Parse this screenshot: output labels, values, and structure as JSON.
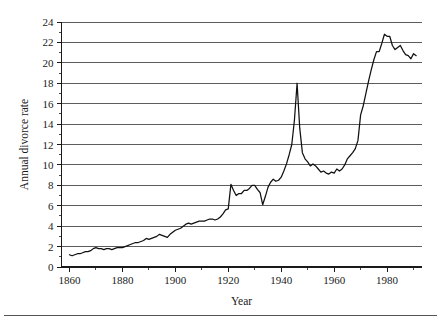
{
  "figure": {
    "background": "#ffffff",
    "line_color": "#111111",
    "grid_color": "#4a4a4a",
    "axis_color": "#1a1a1a",
    "footer_rule": true
  },
  "labels": {
    "ylabel": "Annual divorce rate",
    "xlabel": "Year"
  },
  "chart_data": {
    "type": "line",
    "title": "",
    "xlabel": "Year",
    "ylabel": "Annual divorce rate",
    "xlim": [
      1857,
      1993
    ],
    "ylim": [
      0,
      24
    ],
    "xticks": [
      1860,
      1880,
      1900,
      1920,
      1940,
      1960,
      1980
    ],
    "xticklabels": [
      "1860",
      "1880",
      "1900",
      "1920",
      "1940",
      "1960",
      "1980"
    ],
    "xminorticks": [
      1870,
      1890,
      1910,
      1930,
      1950,
      1970,
      1990
    ],
    "yticks": [
      0,
      2,
      4,
      6,
      8,
      10,
      12,
      14,
      16,
      18,
      20,
      22,
      24
    ],
    "yticklabels": [
      "0",
      "2",
      "4",
      "6",
      "8",
      "10",
      "12",
      "14",
      "16",
      "18",
      "20",
      "22",
      "24"
    ],
    "yminorticks": [
      1,
      3,
      5,
      7,
      9,
      11,
      13,
      15,
      17,
      19,
      21,
      23
    ],
    "grid": "horizontal",
    "legend": "none",
    "series": [
      {
        "name": "Annual divorce rate",
        "x": [
          1860,
          1861,
          1862,
          1863,
          1864,
          1865,
          1866,
          1867,
          1868,
          1869,
          1870,
          1871,
          1872,
          1873,
          1874,
          1875,
          1876,
          1877,
          1878,
          1879,
          1880,
          1881,
          1882,
          1883,
          1884,
          1885,
          1886,
          1887,
          1888,
          1889,
          1890,
          1891,
          1892,
          1893,
          1894,
          1895,
          1896,
          1897,
          1898,
          1899,
          1900,
          1901,
          1902,
          1903,
          1904,
          1905,
          1906,
          1907,
          1908,
          1909,
          1910,
          1911,
          1912,
          1913,
          1914,
          1915,
          1916,
          1917,
          1918,
          1919,
          1920,
          1921,
          1922,
          1923,
          1924,
          1925,
          1926,
          1927,
          1928,
          1929,
          1930,
          1931,
          1932,
          1933,
          1934,
          1935,
          1936,
          1937,
          1938,
          1939,
          1940,
          1941,
          1942,
          1943,
          1944,
          1945,
          1946,
          1947,
          1948,
          1949,
          1950,
          1951,
          1952,
          1953,
          1954,
          1955,
          1956,
          1957,
          1958,
          1959,
          1960,
          1961,
          1962,
          1963,
          1964,
          1965,
          1966,
          1967,
          1968,
          1969,
          1970,
          1971,
          1972,
          1973,
          1974,
          1975,
          1976,
          1977,
          1978,
          1979,
          1980,
          1981,
          1982,
          1983,
          1984,
          1985,
          1986,
          1987,
          1988,
          1989,
          1990,
          1991
        ],
        "y": [
          1.2,
          1.1,
          1.2,
          1.3,
          1.3,
          1.4,
          1.5,
          1.5,
          1.6,
          1.8,
          1.9,
          1.8,
          1.8,
          1.7,
          1.8,
          1.8,
          1.7,
          1.8,
          1.9,
          1.9,
          1.9,
          2.0,
          2.1,
          2.2,
          2.3,
          2.4,
          2.4,
          2.5,
          2.6,
          2.8,
          2.7,
          2.8,
          2.9,
          3.0,
          3.2,
          3.1,
          3.0,
          2.9,
          3.2,
          3.4,
          3.6,
          3.7,
          3.8,
          4.0,
          4.2,
          4.3,
          4.2,
          4.3,
          4.4,
          4.5,
          4.5,
          4.5,
          4.6,
          4.7,
          4.7,
          4.6,
          4.7,
          4.9,
          5.2,
          5.6,
          5.7,
          8.1,
          7.5,
          7.0,
          7.2,
          7.2,
          7.5,
          7.5,
          7.7,
          8.0,
          8.0,
          7.6,
          7.3,
          6.1,
          6.9,
          7.8,
          8.3,
          8.6,
          8.4,
          8.5,
          8.8,
          9.4,
          10.1,
          11.0,
          12.0,
          14.4,
          18.0,
          13.6,
          11.2,
          10.6,
          10.3,
          9.9,
          10.1,
          9.9,
          9.6,
          9.3,
          9.4,
          9.2,
          9.1,
          9.3,
          9.2,
          9.6,
          9.4,
          9.6,
          10.0,
          10.6,
          10.9,
          11.2,
          11.6,
          12.4,
          14.9,
          15.8,
          17.0,
          18.2,
          19.3,
          20.3,
          21.1,
          21.1,
          21.9,
          22.8,
          22.6,
          22.6,
          21.7,
          21.3,
          21.5,
          21.7,
          21.2,
          20.8,
          20.7,
          20.4,
          20.9,
          20.7
        ]
      }
    ]
  }
}
